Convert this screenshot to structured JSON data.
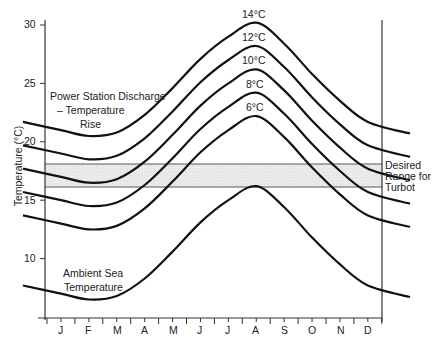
{
  "chart_data": {
    "type": "line",
    "title": "",
    "xlabel": "",
    "ylabel": "Temperature (°C)",
    "ylim": [
      5,
      30
    ],
    "yticks": [
      10,
      15,
      20,
      25,
      30
    ],
    "categories": [
      "J",
      "F",
      "M",
      "A",
      "M",
      "J",
      "J",
      "A",
      "S",
      "O",
      "N",
      "D"
    ],
    "grid": false,
    "series": [
      {
        "name": "Ambient Sea Temperature",
        "offset": 0,
        "values": [
          7.0,
          6.5,
          6.8,
          8.3,
          10.6,
          13.1,
          15.0,
          16.2,
          14.4,
          11.8,
          9.5,
          7.7
        ]
      },
      {
        "name": "6°C",
        "offset": 6,
        "values": [
          13.0,
          12.5,
          12.8,
          14.3,
          16.6,
          19.1,
          21.0,
          22.2,
          20.4,
          17.8,
          15.5,
          13.7
        ]
      },
      {
        "name": "8°C",
        "offset": 8,
        "values": [
          15.0,
          14.5,
          14.8,
          16.3,
          18.6,
          21.1,
          23.0,
          24.2,
          22.4,
          19.8,
          17.5,
          15.7
        ]
      },
      {
        "name": "10°C",
        "offset": 10,
        "values": [
          17.0,
          16.5,
          16.8,
          18.3,
          20.6,
          23.1,
          25.0,
          26.2,
          24.4,
          21.8,
          19.5,
          17.7
        ]
      },
      {
        "name": "12°C",
        "offset": 12,
        "values": [
          19.0,
          18.5,
          18.8,
          20.3,
          22.6,
          25.1,
          27.0,
          28.2,
          26.4,
          23.8,
          21.5,
          19.7
        ]
      },
      {
        "name": "14°C",
        "offset": 14,
        "values": [
          21.0,
          20.5,
          20.8,
          22.3,
          24.6,
          27.1,
          29.0,
          30.2,
          28.4,
          25.8,
          23.5,
          21.7
        ]
      }
    ],
    "band": {
      "name": "Desired Range for Turbot",
      "low": 16,
      "high": 18
    },
    "annotations": [
      "Power Station Discharge – Temperature Rise",
      "Ambient Sea Temperature",
      "Desired Range for Turbot"
    ]
  },
  "labels": {
    "y_axis": "Temperature (°C)",
    "yticks": [
      "10",
      "15",
      "20",
      "25",
      "30"
    ],
    "months": [
      "J",
      "F",
      "M",
      "A",
      "M",
      "J",
      "J",
      "A",
      "S",
      "O",
      "N",
      "D"
    ],
    "discharge_line1": "Power Station Discharge",
    "discharge_line2": "– Temperature",
    "discharge_line3": "Rise",
    "ambient_line1": "Ambient Sea",
    "ambient_line2": "Temperature",
    "band_line1": "Desired",
    "band_line2": "Range for",
    "band_line3": "Turbot",
    "curve_labels": [
      "14°C",
      "12°C",
      "10°C",
      "8°C",
      "6°C"
    ]
  },
  "colors": {
    "line": "#111111",
    "band_fill": "#e6e6e6",
    "axis": "#333333"
  }
}
